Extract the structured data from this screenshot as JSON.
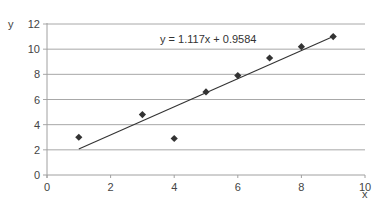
{
  "chart_data": {
    "type": "scatter",
    "title": "",
    "xlabel": "x",
    "ylabel": "y",
    "xlim": [
      0,
      10
    ],
    "ylim": [
      0,
      12
    ],
    "x_ticks": [
      0,
      2,
      4,
      6,
      8,
      10
    ],
    "y_ticks": [
      0,
      2,
      4,
      6,
      8,
      10,
      12
    ],
    "grid": {
      "horizontal": true,
      "vertical": false
    },
    "legend": null,
    "series": [
      {
        "name": "data",
        "marker": "diamond",
        "color": "#333333",
        "x": [
          1,
          3,
          4,
          5,
          6,
          7,
          8,
          9
        ],
        "y": [
          3.0,
          4.8,
          2.9,
          6.6,
          7.9,
          9.3,
          10.2,
          11.0
        ]
      }
    ],
    "trendline": {
      "type": "linear",
      "slope": 1.117,
      "intercept": 0.9584,
      "x_range": [
        1,
        9
      ],
      "color": "#333333"
    },
    "annotations": [
      {
        "text": "y = 1.117x + 0.9584",
        "x": 5,
        "y": 11.5
      }
    ]
  },
  "labels": {
    "x_axis_title": "x",
    "y_axis_title": "y",
    "equation": "y = 1.117x + 0.9584"
  }
}
